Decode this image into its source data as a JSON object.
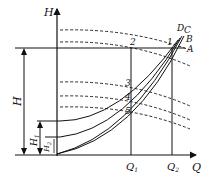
{
  "diagram": {
    "type": "pump-curve-diagram",
    "axes": {
      "y_label": "H",
      "x_label": "Q"
    },
    "head_labels": {
      "total": "H",
      "h1": "H",
      "h1_sub": "1",
      "h2": "H",
      "h2_sub": "2"
    },
    "flow_labels": {
      "q1": "Q",
      "q1_sub": "1",
      "q2": "Q",
      "q2_sub": "2"
    },
    "curve_labels": [
      "A",
      "B",
      "C",
      "D"
    ],
    "points": [
      "1",
      "2",
      "3",
      "4",
      "5"
    ],
    "colors": {
      "line": "#111111",
      "background": "#ffffff"
    }
  }
}
